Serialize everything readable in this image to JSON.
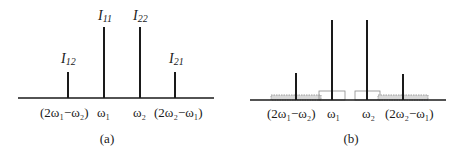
{
  "panel_a": {
    "caption": "(a)",
    "peaks": [
      {
        "name": "I12",
        "label_main": "I",
        "label_sub": "12",
        "freq_label": "(2ω₁−ω₂)"
      },
      {
        "name": "I11",
        "label_main": "I",
        "label_sub": "11",
        "freq_label": "ω₁"
      },
      {
        "name": "I22",
        "label_main": "I",
        "label_sub": "22",
        "freq_label": "ω₂"
      },
      {
        "name": "I21",
        "label_main": "I",
        "label_sub": "21",
        "freq_label": "(2ω₂−ω₁)"
      }
    ]
  },
  "panel_b": {
    "caption": "(b)",
    "freq_labels": [
      "(2ω₁−ω₂)",
      "ω₁",
      "ω₂",
      "(2ω₂−ω₁)"
    ]
  },
  "colors": {
    "line": "#1a1a1a",
    "band_fill": "#d9d9d9",
    "band_stroke": "#8a8a8a"
  }
}
